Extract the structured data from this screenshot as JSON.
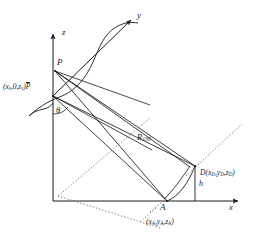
{
  "figure": {
    "type": "geometry-diagram",
    "background_color": "#ffffff",
    "line_color": "#1a1a1a",
    "dotted_color": "#7a7a7a",
    "axes": {
      "z_label": "z",
      "y_label": "y",
      "x_label": "x",
      "origin_label": "O"
    },
    "points": {
      "p_label": "P",
      "pbar_label": "P",
      "pbar_overline": true,
      "a_label": "A",
      "d_label": "D"
    },
    "labels": {
      "source_coord_open": "(",
      "source_coord": "x",
      "source_coord_sub_s": "s",
      "source_coord_mid": ",0,",
      "source_coord_z": "z",
      "source_coord_sub_z": "s",
      "source_coord_close": ")",
      "theta": "θ",
      "range_symbol": "R",
      "range_subscript": "130",
      "height_symbol": "h",
      "d_coord_text": "D(x",
      "d_sub_1": "D",
      "d_mid_1": ",y",
      "d_sub_2": "D",
      "d_mid_2": ",z",
      "d_sub_3": "D",
      "d_close": ")",
      "a_coord_open": "(x",
      "a_sub_1": "A",
      "a_mid_1": ",y",
      "a_sub_2": "A",
      "a_mid_2": ",z",
      "a_sub_3": "A",
      "a_close": ")"
    },
    "geometry": {
      "origin_x": 53,
      "origin_y": 201,
      "z_axis_top_y": 32,
      "x_axis_right_x": 240,
      "p_x": 55,
      "p_y": 71,
      "pbar_x": 53,
      "pbar_y": 96,
      "a_x": 167,
      "a_y": 201,
      "d_x": 195,
      "d_y": 166
    }
  }
}
